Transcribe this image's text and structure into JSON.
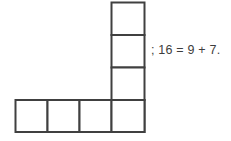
{
  "canvas": {
    "width": 231,
    "height": 141,
    "background_color": "#ffffff"
  },
  "figure": {
    "name": "L-shaped polyomino",
    "type": "grid-figure",
    "stroke_color": "#404040",
    "fill_color": "#ffffff",
    "stroke_width": 2,
    "cell_size": 32.5,
    "total_cells": 7,
    "column": {
      "label": "vertical column of squares",
      "cell_count": 4,
      "x": 111,
      "y": 100,
      "width": 34,
      "cell_height": 32.5,
      "top": 2
    },
    "row": {
      "label": "horizontal row of squares",
      "cell_count": 4,
      "x": 15,
      "y": 100,
      "height": 32.5,
      "cell_width": 32.5,
      "right": 145
    },
    "corner_cell_shared": true
  },
  "annotation": {
    "equation": "; 16 = 9 + 7.",
    "color": "#3d3d3d",
    "x": 151,
    "y": 41
  }
}
